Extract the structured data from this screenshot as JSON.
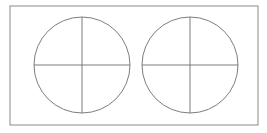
{
  "figure": {
    "background_color": "#ffffff",
    "canvas": {
      "width": 267,
      "height": 133
    },
    "frame": {
      "label": "outer rectangular border",
      "x": 10,
      "y": 6,
      "width": 248,
      "height": 119,
      "stroke_color": "#8a8a8a",
      "stroke_width": 1,
      "fill_color": "#ffffff"
    },
    "shapes": [
      {
        "name": "left-circle",
        "label": "Left circle",
        "center_x": 82,
        "center_y": 65,
        "radius": 48,
        "stroke_color": "#6e6e6e",
        "stroke_width": 0.9,
        "fill_color": "none",
        "divisions": [
          {
            "name": "left-circle-vertical-diameter",
            "label": "Vertical diameter",
            "x1": 82,
            "y1": 17,
            "x2": 82,
            "y2": 113
          },
          {
            "name": "left-circle-horizontal-diameter",
            "label": "Horizontal diameter",
            "x1": 34,
            "y1": 65,
            "x2": 130,
            "y2": 65
          }
        ]
      },
      {
        "name": "right-circle",
        "label": "Right circle",
        "center_x": 190,
        "center_y": 65,
        "radius": 48,
        "stroke_color": "#6e6e6e",
        "stroke_width": 0.9,
        "fill_color": "none",
        "divisions": [
          {
            "name": "right-circle-vertical-diameter",
            "label": "Vertical diameter",
            "x1": 190,
            "y1": 17,
            "x2": 190,
            "y2": 113
          },
          {
            "name": "right-circle-horizontal-diameter",
            "label": "Horizontal diameter",
            "x1": 142,
            "y1": 65,
            "x2": 238,
            "y2": 65
          }
        ]
      }
    ],
    "colors": {
      "line": "#6e6e6e",
      "frame": "#8a8a8a",
      "background": "#ffffff"
    }
  }
}
